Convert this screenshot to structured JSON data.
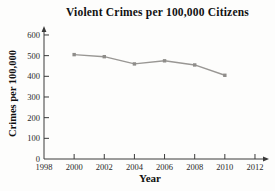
{
  "chart_data": {
    "type": "line",
    "title": "Violent Crimes per 100,000 Citizens",
    "xlabel": "Year",
    "ylabel": "Crimes per 100,000",
    "x": [
      2000,
      2002,
      2004,
      2006,
      2008,
      2010
    ],
    "values": [
      505,
      495,
      460,
      475,
      455,
      405
    ],
    "xticks": [
      1998,
      2000,
      2002,
      2004,
      2006,
      2008,
      2010,
      2012
    ],
    "yticks": [
      0,
      100,
      200,
      300,
      400,
      500,
      600
    ],
    "xlim": [
      1998,
      2013
    ],
    "ylim": [
      0,
      640
    ],
    "grid": false,
    "legend": null,
    "line_color": "#999794",
    "marker_color": "#8f8d8a",
    "axis_color": "#3a3a3a",
    "tick_label_color": "#2a2a2a"
  }
}
